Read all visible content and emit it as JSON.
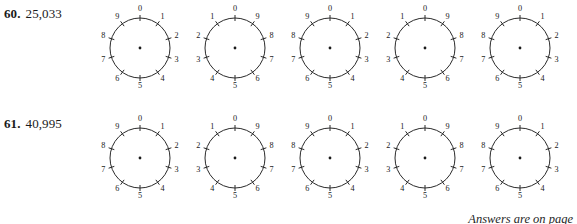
{
  "page": {
    "background_color": "#ffffff",
    "ink_color": "#1a1a1a"
  },
  "problems": [
    {
      "number": "60.",
      "value": "25,033",
      "dials": [
        {
          "direction": "clockwise",
          "digits": [
            "0",
            "1",
            "2",
            "3",
            "4",
            "5",
            "6",
            "7",
            "8",
            "9"
          ]
        },
        {
          "direction": "counterclockwise",
          "digits": [
            "0",
            "1",
            "2",
            "3",
            "4",
            "5",
            "6",
            "7",
            "8",
            "9"
          ]
        },
        {
          "direction": "clockwise",
          "digits": [
            "0",
            "1",
            "2",
            "3",
            "4",
            "5",
            "6",
            "7",
            "8",
            "9"
          ]
        },
        {
          "direction": "counterclockwise",
          "digits": [
            "0",
            "1",
            "2",
            "3",
            "4",
            "5",
            "6",
            "7",
            "8",
            "9"
          ]
        },
        {
          "direction": "clockwise",
          "digits": [
            "0",
            "1",
            "2",
            "3",
            "4",
            "5",
            "6",
            "7",
            "8",
            "9"
          ]
        }
      ]
    },
    {
      "number": "61.",
      "value": "40,995",
      "dials": [
        {
          "direction": "clockwise",
          "digits": [
            "0",
            "1",
            "2",
            "3",
            "4",
            "5",
            "6",
            "7",
            "8",
            "9"
          ]
        },
        {
          "direction": "counterclockwise",
          "digits": [
            "0",
            "1",
            "2",
            "3",
            "4",
            "5",
            "6",
            "7",
            "8",
            "9"
          ]
        },
        {
          "direction": "clockwise",
          "digits": [
            "0",
            "1",
            "2",
            "3",
            "4",
            "5",
            "6",
            "7",
            "8",
            "9"
          ]
        },
        {
          "direction": "counterclockwise",
          "digits": [
            "0",
            "1",
            "2",
            "3",
            "4",
            "5",
            "6",
            "7",
            "8",
            "9"
          ]
        },
        {
          "direction": "clockwise",
          "digits": [
            "0",
            "1",
            "2",
            "3",
            "4",
            "5",
            "6",
            "7",
            "8",
            "9"
          ]
        }
      ]
    }
  ],
  "footer": {
    "note": "Answers are on page"
  }
}
